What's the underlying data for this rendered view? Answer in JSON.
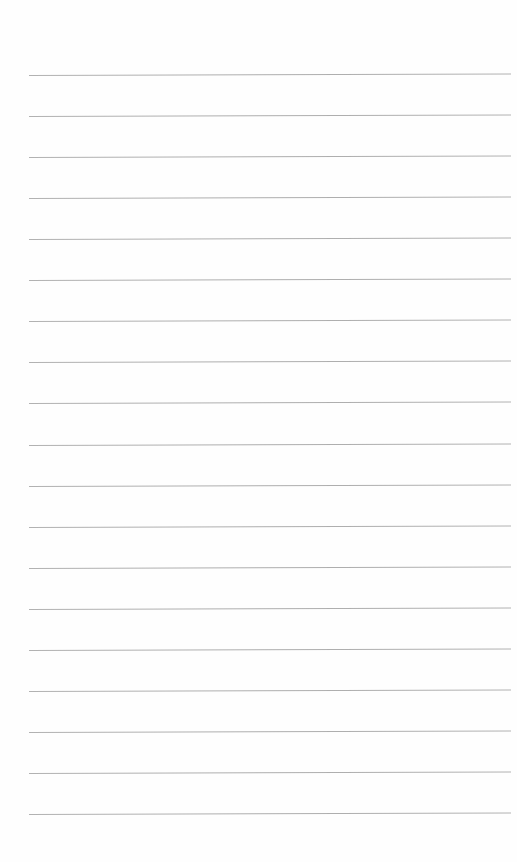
{
  "page": {
    "type": "lined-paper",
    "background_color": "#fefefe",
    "rule_color": "#a6a6a6",
    "rule_count": 19,
    "first_rule_y": 75,
    "rule_spacing": 41.06,
    "rule_left": 29,
    "rule_right": 511,
    "text_lines": [
      "",
      "",
      "",
      "",
      "",
      "",
      "",
      "",
      "",
      "",
      "",
      "",
      "",
      "",
      "",
      "",
      "",
      "",
      ""
    ]
  }
}
